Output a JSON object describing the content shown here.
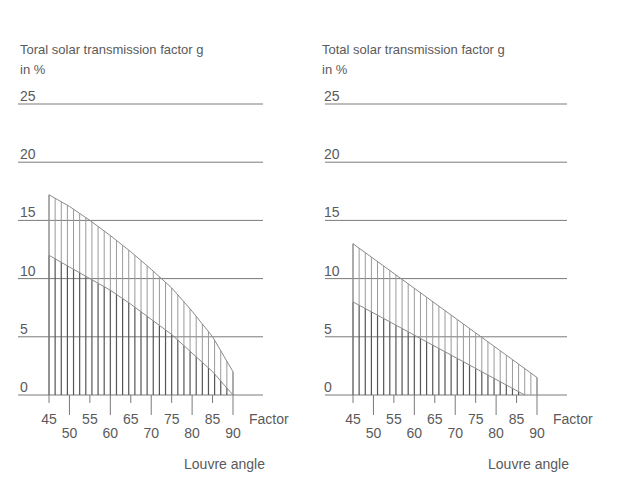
{
  "chart_data": [
    {
      "type": "area",
      "title": "Toral solar transmission factor g",
      "subtitle": "in %",
      "ylabel": "Toral solar transmission factor g in %",
      "xlabel": "Louvre angle",
      "x_unit_label": "Factor",
      "ylim": [
        0,
        25
      ],
      "xlim": [
        45,
        90
      ],
      "yticks": [
        0,
        5,
        10,
        15,
        20,
        25
      ],
      "xticks_upper": [
        45,
        55,
        65,
        75,
        85
      ],
      "xticks_lower": [
        50,
        60,
        70,
        80,
        90
      ],
      "grid": true,
      "hatch_step": 1.5,
      "series": [
        {
          "name": "upper",
          "x": [
            45,
            50,
            55,
            60,
            65,
            70,
            75,
            80,
            85,
            90
          ],
          "values": [
            17.2,
            16.2,
            15.0,
            13.7,
            12.3,
            10.8,
            9.2,
            7.2,
            5.0,
            2.0
          ]
        },
        {
          "name": "lower",
          "x": [
            45,
            50,
            55,
            60,
            65,
            70,
            75,
            80,
            85,
            90
          ],
          "values": [
            12.0,
            11.0,
            10.0,
            9.0,
            7.8,
            6.5,
            5.2,
            3.6,
            2.0,
            0.0
          ]
        }
      ]
    },
    {
      "type": "area",
      "title": "Total solar transmission factor g",
      "subtitle": "in %",
      "ylabel": "Total solar transmission factor g in %",
      "xlabel": "Louvre angle",
      "x_unit_label": "Factor",
      "ylim": [
        0,
        25
      ],
      "xlim": [
        45,
        90
      ],
      "yticks": [
        0,
        5,
        10,
        15,
        20,
        25
      ],
      "xticks_upper": [
        45,
        55,
        65,
        75,
        85
      ],
      "xticks_lower": [
        50,
        60,
        70,
        80,
        90
      ],
      "grid": true,
      "hatch_step": 1.5,
      "series": [
        {
          "name": "upper",
          "x": [
            45,
            90
          ],
          "values": [
            13.0,
            1.5
          ]
        },
        {
          "name": "lower",
          "x": [
            45,
            87
          ],
          "values": [
            8.0,
            0.0
          ]
        }
      ]
    }
  ]
}
